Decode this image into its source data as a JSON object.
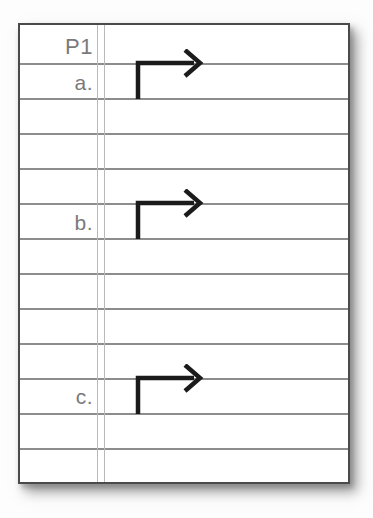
{
  "page": {
    "label": "P1"
  },
  "items": [
    {
      "label": "a.",
      "icon": "elbow-arrow-right-icon"
    },
    {
      "label": "b.",
      "icon": "elbow-arrow-right-icon"
    },
    {
      "label": "c.",
      "icon": "elbow-arrow-right-icon"
    }
  ],
  "colors": {
    "paper": "#ffffff",
    "paper_border": "#4a4a4a",
    "ruled_line": "#8d8d8d",
    "margin_line": "#b9b9b9",
    "label_text": "#7a7a7a",
    "arrow": "#1b1b1b",
    "shadow": "#8a8a8a"
  }
}
